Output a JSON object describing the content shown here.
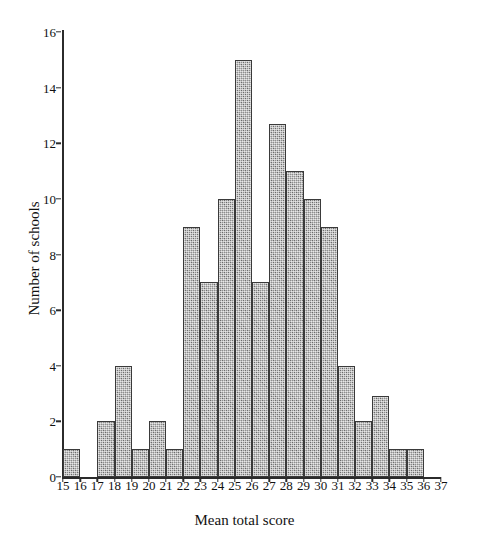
{
  "chart_data": {
    "type": "bar",
    "title": "",
    "subtitle": "",
    "xlabel": "Mean total score",
    "ylabel": "Number of schools",
    "grid": false,
    "legend": null,
    "bin_width": 1,
    "xlim": [
      15,
      37
    ],
    "ylim": [
      0,
      16
    ],
    "xticks": [
      15,
      16,
      17,
      18,
      19,
      20,
      21,
      22,
      23,
      24,
      25,
      26,
      27,
      28,
      29,
      30,
      31,
      32,
      33,
      34,
      35,
      36,
      37
    ],
    "yticks": [
      0,
      2,
      4,
      6,
      8,
      10,
      12,
      14,
      16
    ],
    "bin_starts": [
      15,
      16,
      17,
      18,
      19,
      20,
      21,
      22,
      23,
      24,
      25,
      26,
      27,
      28,
      29,
      30,
      31,
      32,
      33,
      34,
      35,
      36
    ],
    "categories": [
      "15-16",
      "16-17",
      "17-18",
      "18-19",
      "19-20",
      "20-21",
      "21-22",
      "22-23",
      "23-24",
      "24-25",
      "25-26",
      "26-27",
      "27-28",
      "28-29",
      "29-30",
      "30-31",
      "31-32",
      "32-33",
      "33-34",
      "34-35",
      "35-36",
      "36-37"
    ],
    "values": [
      1,
      0,
      2,
      4,
      1,
      2,
      1,
      9,
      7,
      10,
      15,
      7,
      12.7,
      11,
      10,
      9,
      4,
      2,
      2.9,
      1,
      1,
      0
    ],
    "bar_fill_color": "#8e8e8e",
    "bar_edge_color": "#3a3a3a",
    "axis_color": "#2b2b2b"
  }
}
